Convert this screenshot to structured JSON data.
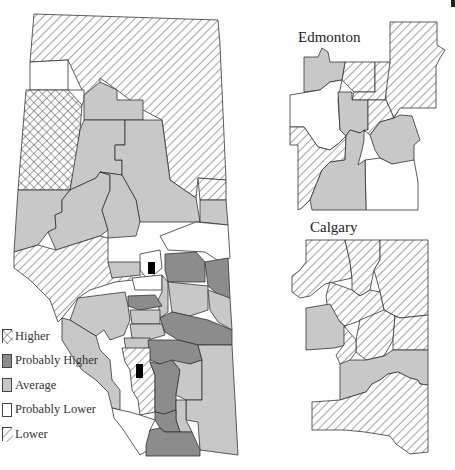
{
  "main_map": {
    "name": "Alberta",
    "categories": [
      "Higher",
      "Probably Higher",
      "Average",
      "Probably Lower",
      "Lower"
    ]
  },
  "insets": {
    "edmonton": {
      "title": "Edmonton"
    },
    "calgary": {
      "title": "Calgary"
    }
  },
  "legend": {
    "items": [
      {
        "label": "Higher",
        "pattern": "crosshatch",
        "color": "#ffffff"
      },
      {
        "label": "Probably Higher",
        "pattern": "solid",
        "color": "#8c8c8c"
      },
      {
        "label": "Average",
        "pattern": "solid",
        "color": "#c8c8c8"
      },
      {
        "label": "Probably Lower",
        "pattern": "solid",
        "color": "#ffffff"
      },
      {
        "label": "Lower",
        "pattern": "diagonal",
        "color": "#ffffff"
      }
    ]
  }
}
